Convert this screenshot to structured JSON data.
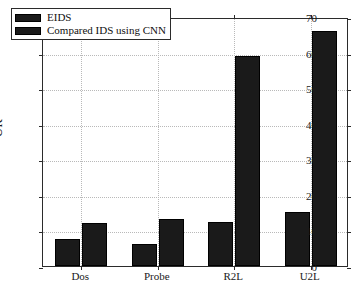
{
  "chart_data": {
    "type": "bar",
    "title": "",
    "xlabel": "",
    "ylabel": "UR",
    "categories": [
      "Dos",
      "Probe",
      "R2L",
      "U2L"
    ],
    "series": [
      {
        "name": "EIDS",
        "values": [
          7.5,
          6.2,
          12.5,
          15.1
        ],
        "color": "#1a1a1a"
      },
      {
        "name": "Compared IDS using CNN",
        "values": [
          12.1,
          13.1,
          59.0,
          66.0
        ],
        "color": "#1a1a1a"
      }
    ],
    "ylim": [
      0,
      70
    ],
    "yticks": [
      0,
      10,
      20,
      30,
      40,
      50,
      60,
      70
    ],
    "ytick_labels": [
      "0",
      "10",
      "20",
      "30",
      "40",
      "50",
      "60",
      "70"
    ],
    "grid": true,
    "grid_style": "dotted",
    "legend_position": "top-left"
  },
  "axes": {
    "y_title": "UR",
    "frame_color": "#2b2b2b",
    "grid_color": "#b9b9b9",
    "background": "#ffffff"
  },
  "legend": {
    "entries": [
      {
        "label": "EIDS"
      },
      {
        "label": "Compared IDS using CNN"
      }
    ]
  }
}
